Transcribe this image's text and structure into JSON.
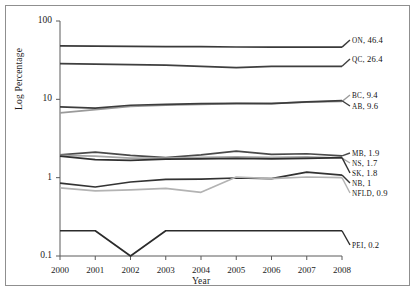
{
  "chart_data": {
    "type": "line",
    "title": "",
    "xlabel": "Year",
    "ylabel": "Log Percentage",
    "x": [
      2000,
      2001,
      2002,
      2003,
      2004,
      2005,
      2006,
      2007,
      2008
    ],
    "categories": [
      "2000",
      "2001",
      "2002",
      "2003",
      "2004",
      "2005",
      "2006",
      "2007",
      "2008"
    ],
    "yscale": "log",
    "ylim": [
      0.1,
      100
    ],
    "ytick_labels": [
      "100",
      "10",
      "1",
      "0.1"
    ],
    "ytick_values": [
      100,
      10,
      1,
      0.1
    ],
    "grid": false,
    "legend_position": "right-inline-labels",
    "series": [
      {
        "name": "ON",
        "end_label": "ON, 46.4",
        "end_value": 46.4,
        "color": "#3a3a3a",
        "values": [
          48.0,
          47.8,
          47.4,
          47.2,
          47.0,
          46.6,
          46.5,
          46.5,
          46.4
        ]
      },
      {
        "name": "QC",
        "end_label": "QC, 26.4",
        "end_value": 26.4,
        "color": "#3f3f3f",
        "values": [
          28.5,
          28.2,
          27.8,
          27.3,
          26.4,
          25.4,
          26.3,
          26.4,
          26.4
        ]
      },
      {
        "name": "BC",
        "end_label": "BC, 9.4",
        "end_value": 9.4,
        "color": "#9a9a9a",
        "values": [
          6.7,
          7.4,
          8.1,
          8.4,
          8.6,
          8.8,
          8.9,
          9.2,
          9.4
        ]
      },
      {
        "name": "AB",
        "end_label": "AB, 9.6",
        "end_value": 9.6,
        "color": "#3d3d3d",
        "values": [
          8.0,
          7.7,
          8.4,
          8.6,
          8.8,
          8.9,
          8.8,
          9.3,
          9.6
        ]
      },
      {
        "name": "MB",
        "end_label": "MB, 1.9",
        "end_value": 1.9,
        "color": "#4a4a4a",
        "values": [
          1.95,
          2.12,
          1.92,
          1.8,
          1.95,
          2.18,
          1.98,
          2.02,
          1.9
        ]
      },
      {
        "name": "NS",
        "end_label": "NS, 1.7",
        "end_value": 1.7,
        "color": "#a6a6a6",
        "values": [
          1.92,
          1.88,
          1.78,
          1.78,
          1.82,
          1.85,
          1.82,
          1.84,
          1.78
        ]
      },
      {
        "name": "SK",
        "end_label": "SK, 1.8",
        "end_value": 1.8,
        "color": "#2f2f2f",
        "values": [
          1.88,
          1.7,
          1.66,
          1.72,
          1.74,
          1.76,
          1.74,
          1.76,
          1.8
        ]
      },
      {
        "name": "NB",
        "end_label": "NB, 1",
        "end_value": 1,
        "color": "#333333",
        "values": [
          0.85,
          0.76,
          0.88,
          0.95,
          0.96,
          0.99,
          0.97,
          1.18,
          1.08
        ]
      },
      {
        "name": "NFLD",
        "end_label": "NFLD, 0.9",
        "end_value": 0.9,
        "color": "#b3b3b3",
        "values": [
          0.74,
          0.68,
          0.7,
          0.73,
          0.65,
          1.02,
          0.97,
          1.02,
          1.0
        ]
      },
      {
        "name": "PEI",
        "end_label": "PEI, 0.2",
        "end_value": 0.2,
        "color": "#2b2b2b",
        "values": [
          0.21,
          0.21,
          0.1,
          0.21,
          0.21,
          0.21,
          0.21,
          0.21,
          0.21
        ]
      }
    ]
  }
}
